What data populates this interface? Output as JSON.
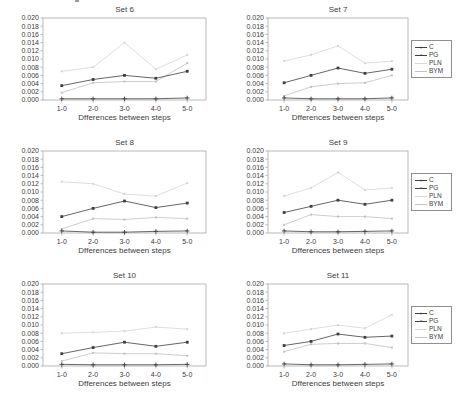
{
  "page": {
    "background": "#ffffff"
  },
  "colors": {
    "frame": "#a9a9a9",
    "tick_text": "#3d3d3d",
    "dark": "#3f3f3f",
    "pln": "#d6d6d6",
    "bym": "#c2c2c2",
    "legend_border": "#8f8f8f"
  },
  "legend": {
    "entries": [
      {
        "label": "C",
        "marker_glyph": "+",
        "color_key": "dark"
      },
      {
        "label": "PG",
        "marker_glyph": "▪",
        "color_key": "dark"
      },
      {
        "label": "PLN",
        "marker_glyph": "",
        "color_key": "pln"
      },
      {
        "label": "BYM",
        "marker_glyph": "",
        "color_key": "bym"
      }
    ]
  },
  "chart_data": [
    {
      "type": "line",
      "title": "Set 6",
      "xlabel": "Dfferences between steps",
      "categories": [
        "1-0",
        "2-0",
        "3-0",
        "4-0",
        "5-0"
      ],
      "ylim": [
        0,
        0.02
      ],
      "yticks": [
        "0.000",
        "0.002",
        "0.004",
        "0.006",
        "0.008",
        "0.010",
        "0.012",
        "0.014",
        "0.016",
        "0.018",
        "0.020"
      ],
      "grid": false,
      "legend_position": "none",
      "series": [
        {
          "name": "C",
          "color_key": "dark",
          "marker": "plus",
          "values": [
            0.0003,
            0.0003,
            0.0003,
            0.0003,
            0.0005
          ]
        },
        {
          "name": "PG",
          "color_key": "dark",
          "marker": "square",
          "values": [
            0.0035,
            0.005,
            0.006,
            0.0053,
            0.007
          ]
        },
        {
          "name": "PLN",
          "color_key": "pln",
          "marker": "dot",
          "values": [
            0.007,
            0.008,
            0.014,
            0.0075,
            0.011
          ]
        },
        {
          "name": "BYM",
          "color_key": "bym",
          "marker": "dot",
          "values": [
            0.0018,
            0.0042,
            0.0045,
            0.0045,
            0.009
          ]
        }
      ]
    },
    {
      "type": "line",
      "title": "Set 7",
      "xlabel": "Dfferences between steps",
      "categories": [
        "1-0",
        "2-0",
        "3-0",
        "4-0",
        "5-0"
      ],
      "ylim": [
        0,
        0.02
      ],
      "yticks": [
        "0.000",
        "0.002",
        "0.004",
        "0.006",
        "0.008",
        "0.010",
        "0.012",
        "0.014",
        "0.016",
        "0.018",
        "0.020"
      ],
      "grid": false,
      "legend_position": "right",
      "series": [
        {
          "name": "C",
          "color_key": "dark",
          "marker": "plus",
          "values": [
            0.0005,
            0.0003,
            0.0003,
            0.0003,
            0.0005
          ]
        },
        {
          "name": "PG",
          "color_key": "dark",
          "marker": "square",
          "values": [
            0.0042,
            0.006,
            0.0078,
            0.0065,
            0.0075
          ]
        },
        {
          "name": "PLN",
          "color_key": "pln",
          "marker": "dot",
          "values": [
            0.0095,
            0.011,
            0.0132,
            0.009,
            0.0095
          ]
        },
        {
          "name": "BYM",
          "color_key": "bym",
          "marker": "dot",
          "values": [
            0.001,
            0.0032,
            0.004,
            0.0042,
            0.006
          ]
        }
      ]
    },
    {
      "type": "line",
      "title": "Set 8",
      "xlabel": "Dfferences between steps",
      "categories": [
        "1-0",
        "2-0",
        "3-0",
        "4-0",
        "5-0"
      ],
      "ylim": [
        0,
        0.02
      ],
      "yticks": [
        "0.000",
        "0.002",
        "0.004",
        "0.006",
        "0.008",
        "0.010",
        "0.012",
        "0.014",
        "0.016",
        "0.018",
        "0.020"
      ],
      "grid": false,
      "legend_position": "none",
      "series": [
        {
          "name": "C",
          "color_key": "dark",
          "marker": "plus",
          "values": [
            0.0005,
            0.0002,
            0.0002,
            0.0004,
            0.0005
          ]
        },
        {
          "name": "PG",
          "color_key": "dark",
          "marker": "square",
          "values": [
            0.004,
            0.006,
            0.0078,
            0.0062,
            0.0073
          ]
        },
        {
          "name": "PLN",
          "color_key": "pln",
          "marker": "dot",
          "values": [
            0.0125,
            0.012,
            0.0095,
            0.009,
            0.0122
          ]
        },
        {
          "name": "BYM",
          "color_key": "bym",
          "marker": "dot",
          "values": [
            0.001,
            0.0035,
            0.0033,
            0.0038,
            0.0035
          ]
        }
      ]
    },
    {
      "type": "line",
      "title": "Set 9",
      "xlabel": "Dfferences between steps",
      "categories": [
        "1-0",
        "2-0",
        "3-0",
        "4-0",
        "5-0"
      ],
      "ylim": [
        0,
        0.02
      ],
      "yticks": [
        "0.000",
        "0.002",
        "0.004",
        "0.006",
        "0.008",
        "0.010",
        "0.012",
        "0.014",
        "0.016",
        "0.018",
        "0.020"
      ],
      "grid": false,
      "legend_position": "right",
      "series": [
        {
          "name": "C",
          "color_key": "dark",
          "marker": "plus",
          "values": [
            0.0005,
            0.0003,
            0.0003,
            0.0004,
            0.0005
          ]
        },
        {
          "name": "PG",
          "color_key": "dark",
          "marker": "square",
          "values": [
            0.005,
            0.0065,
            0.008,
            0.007,
            0.008
          ]
        },
        {
          "name": "PLN",
          "color_key": "pln",
          "marker": "dot",
          "values": [
            0.009,
            0.011,
            0.0148,
            0.0105,
            0.011
          ]
        },
        {
          "name": "BYM",
          "color_key": "bym",
          "marker": "dot",
          "values": [
            0.002,
            0.0045,
            0.004,
            0.004,
            0.0035
          ]
        }
      ]
    },
    {
      "type": "line",
      "title": "Set 10",
      "xlabel": "Dfferences between steps",
      "categories": [
        "1-0",
        "2-0",
        "3-0",
        "4-0",
        "5-0"
      ],
      "ylim": [
        0,
        0.02
      ],
      "yticks": [
        "0.000",
        "0.002",
        "0.004",
        "0.006",
        "0.008",
        "0.010",
        "0.012",
        "0.014",
        "0.016",
        "0.018",
        "0.020"
      ],
      "grid": false,
      "legend_position": "none",
      "series": [
        {
          "name": "C",
          "color_key": "dark",
          "marker": "plus",
          "values": [
            0.0004,
            0.0003,
            0.0003,
            0.0003,
            0.0004
          ]
        },
        {
          "name": "PG",
          "color_key": "dark",
          "marker": "square",
          "values": [
            0.003,
            0.0045,
            0.0058,
            0.0048,
            0.0058
          ]
        },
        {
          "name": "PLN",
          "color_key": "pln",
          "marker": "dot",
          "values": [
            0.008,
            0.0082,
            0.0085,
            0.0095,
            0.009
          ]
        },
        {
          "name": "BYM",
          "color_key": "bym",
          "marker": "dot",
          "values": [
            0.0012,
            0.0032,
            0.003,
            0.003,
            0.0025
          ]
        }
      ]
    },
    {
      "type": "line",
      "title": "Set 11",
      "xlabel": "Dfferences between steps",
      "categories": [
        "1-0",
        "2-0",
        "3-0",
        "4-0",
        "5-0"
      ],
      "ylim": [
        0,
        0.02
      ],
      "yticks": [
        "0.000",
        "0.002",
        "0.004",
        "0.006",
        "0.008",
        "0.010",
        "0.012",
        "0.014",
        "0.016",
        "0.018",
        "0.020"
      ],
      "grid": false,
      "legend_position": "right",
      "series": [
        {
          "name": "C",
          "color_key": "dark",
          "marker": "plus",
          "values": [
            0.0005,
            0.0003,
            0.0003,
            0.0004,
            0.0005
          ]
        },
        {
          "name": "PG",
          "color_key": "dark",
          "marker": "square",
          "values": [
            0.005,
            0.006,
            0.0078,
            0.007,
            0.0073
          ]
        },
        {
          "name": "PLN",
          "color_key": "pln",
          "marker": "dot",
          "values": [
            0.008,
            0.009,
            0.01,
            0.0092,
            0.0125
          ]
        },
        {
          "name": "BYM",
          "color_key": "bym",
          "marker": "dot",
          "values": [
            0.0035,
            0.0053,
            0.0055,
            0.0055,
            0.0045
          ]
        }
      ]
    }
  ]
}
